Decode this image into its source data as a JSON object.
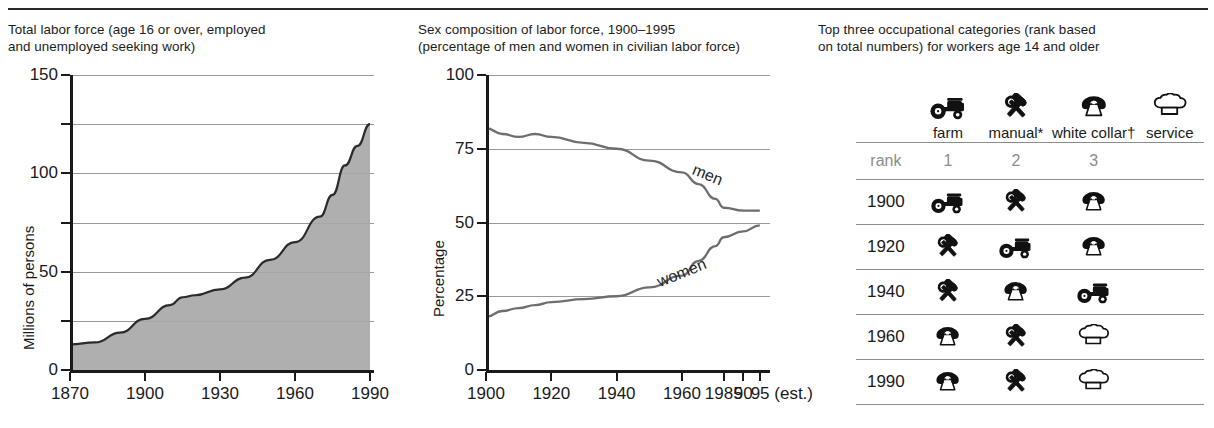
{
  "panels": {
    "left": {
      "caption": "Total labor force (age 16 or over, employed\nand unemployed seeking work)"
    },
    "middle": {
      "caption": "Sex composition of labor force, 1900–1995\n(percentage of men and women in civilian labor force)"
    },
    "right": {
      "caption": "Top three occupational categories (rank based\non total numbers) for workers age 14 and older"
    }
  },
  "chart_data": [
    {
      "type": "area",
      "title": "Total labor force (age 16 or over, employed and unemployed seeking work)",
      "xlabel": "",
      "ylabel": "Millions of persons",
      "ylim": [
        0,
        150
      ],
      "xlim": [
        1870,
        1990
      ],
      "yticks": [
        0,
        50,
        100,
        150
      ],
      "ytick_labels": [
        "0",
        "50",
        "100",
        "150"
      ],
      "gridlines": [
        25,
        50,
        75,
        100,
        125,
        150
      ],
      "xticks": [
        1870,
        1900,
        1930,
        1960,
        1990
      ],
      "xtick_labels": [
        "1870",
        "1900",
        "1930",
        "1960",
        "1990"
      ],
      "grid": true,
      "fill_color": "#a8a8a8",
      "line_color": "#2b2b2b",
      "x": [
        1870,
        1880,
        1890,
        1900,
        1910,
        1915,
        1920,
        1930,
        1940,
        1950,
        1960,
        1970,
        1975,
        1980,
        1985,
        1990
      ],
      "values": [
        13,
        14,
        19,
        26,
        33,
        37,
        38,
        41,
        47,
        56,
        65,
        78,
        89,
        104,
        114,
        125
      ]
    },
    {
      "type": "line",
      "title": "Sex composition of labor force, 1900–1995 (percentage of men and women in civilian labor force)",
      "xlabel": "",
      "ylabel": "Percentage",
      "ylim": [
        0,
        100
      ],
      "xlim": [
        1900,
        1995
      ],
      "yticks": [
        0,
        25,
        50,
        75,
        100
      ],
      "ytick_labels": [
        "0",
        "25",
        "50",
        "75",
        "100"
      ],
      "gridlines": [
        25,
        50,
        75,
        100
      ],
      "xticks": [
        1900,
        1920,
        1940,
        1960,
        1985,
        1990,
        1995
      ],
      "xtick_labels": [
        "1900",
        "1920",
        "1940",
        "1960",
        "1985",
        "90",
        "95 (est.)"
      ],
      "grid": true,
      "line_color": "#6e6e6e",
      "x": [
        1900,
        1905,
        1910,
        1915,
        1920,
        1930,
        1940,
        1950,
        1960,
        1970,
        1980,
        1985,
        1990,
        1995
      ],
      "series": [
        {
          "name": "men",
          "label": "men",
          "values": [
            82,
            80,
            79,
            80,
            79,
            77,
            75,
            71,
            67,
            63,
            58,
            55,
            54,
            54
          ]
        },
        {
          "name": "women",
          "label": "women",
          "values": [
            18,
            20,
            21,
            22,
            23,
            24,
            25,
            28,
            32,
            37,
            42,
            45,
            47,
            49
          ]
        }
      ]
    },
    {
      "type": "table",
      "title": "Top three occupational categories (rank based on total numbers) for workers age 14 and older",
      "legend": [
        {
          "icon": "tractor-icon",
          "label": "farm"
        },
        {
          "icon": "hammer-wrench-icon",
          "label": "manual*"
        },
        {
          "icon": "telephone-icon",
          "label": "white collar†"
        },
        {
          "icon": "chef-hat-icon",
          "label": "service"
        }
      ],
      "rank_row": {
        "label": "rank",
        "ranks": [
          "1",
          "2",
          "3"
        ]
      },
      "rows": [
        {
          "year": "1900",
          "icons": [
            "tractor-icon",
            "hammer-wrench-icon",
            "telephone-icon"
          ]
        },
        {
          "year": "1920",
          "icons": [
            "hammer-wrench-icon",
            "tractor-icon",
            "telephone-icon"
          ]
        },
        {
          "year": "1940",
          "icons": [
            "hammer-wrench-icon",
            "telephone-icon",
            "tractor-icon"
          ]
        },
        {
          "year": "1960",
          "icons": [
            "telephone-icon",
            "hammer-wrench-icon",
            "chef-hat-icon"
          ]
        },
        {
          "year": "1990",
          "icons": [
            "telephone-icon",
            "hammer-wrench-icon",
            "chef-hat-icon"
          ]
        }
      ]
    }
  ]
}
